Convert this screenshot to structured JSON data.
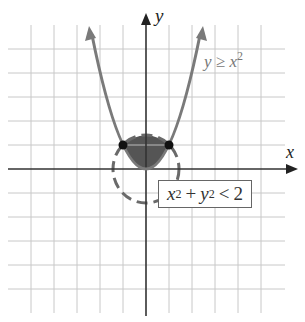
{
  "diagram": {
    "type": "system-of-inequalities-graph",
    "axes": {
      "x_label": "x",
      "y_label": "y"
    },
    "grid": {
      "x_range": [
        -6,
        6
      ],
      "y_range": [
        -6,
        6
      ],
      "step": 1
    },
    "curves": [
      {
        "name": "parabola",
        "equation": "y = x^2",
        "boundary": "solid",
        "color": "#7a7a7a"
      },
      {
        "name": "circle",
        "equation": "x^2 + y^2 = 2",
        "boundary": "dashed",
        "color": "#6a6a6a"
      }
    ],
    "intersection_points": [
      {
        "x": -1,
        "y": 1
      },
      {
        "x": 1,
        "y": 1
      }
    ],
    "shaded_region_color": "#555555",
    "labels": {
      "parabola": {
        "lhs": "y",
        "op": "≥",
        "base": "x",
        "exp": "2"
      },
      "circle": {
        "t1": "x",
        "e1": "2",
        "plus": "+",
        "t2": "y",
        "e2": "2",
        "op": "<",
        "rhs": "2"
      }
    }
  }
}
